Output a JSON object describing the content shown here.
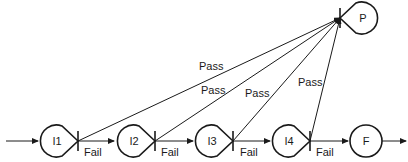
{
  "diagram": {
    "type": "state-flow",
    "nodes": [
      {
        "id": "I1",
        "label": "I1",
        "shape": "teardrop"
      },
      {
        "id": "I2",
        "label": "I2",
        "shape": "teardrop"
      },
      {
        "id": "I3",
        "label": "I3",
        "shape": "teardrop"
      },
      {
        "id": "I4",
        "label": "I4",
        "shape": "teardrop"
      },
      {
        "id": "F",
        "label": "F",
        "shape": "circle"
      },
      {
        "id": "P",
        "label": "P",
        "shape": "teardrop"
      }
    ],
    "edges": [
      {
        "from": "I1",
        "to": "I2",
        "label": "Fail"
      },
      {
        "from": "I2",
        "to": "I3",
        "label": "Fail"
      },
      {
        "from": "I3",
        "to": "I4",
        "label": "Fail"
      },
      {
        "from": "I4",
        "to": "F",
        "label": "Fail"
      },
      {
        "from": "I1",
        "to": "P",
        "label": "Pass"
      },
      {
        "from": "I2",
        "to": "P",
        "label": "Pass"
      },
      {
        "from": "I3",
        "to": "P",
        "label": "Pass"
      },
      {
        "from": "I4",
        "to": "P",
        "label": "Pass"
      }
    ],
    "colors": {
      "stroke": "#1a1a1a",
      "background": "#ffffff"
    }
  }
}
